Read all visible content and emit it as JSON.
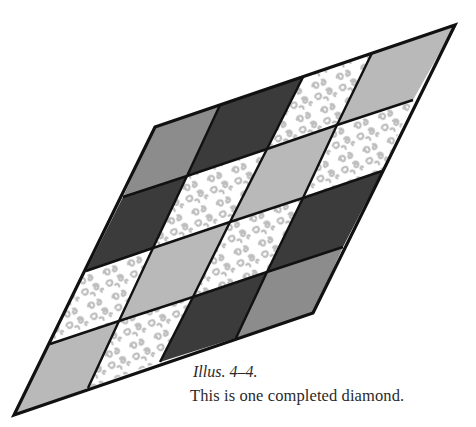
{
  "figure": {
    "grid_rows": 4,
    "grid_cols": 4,
    "vertices": [
      [
        [
          155,
          127
        ],
        [
          220,
          105
        ],
        [
          303,
          77
        ],
        [
          372,
          53
        ],
        [
          455,
          25
        ]
      ],
      [
        [
          123,
          197
        ],
        [
          187,
          176
        ],
        [
          267,
          149
        ],
        [
          337,
          125
        ],
        [
          413,
          100
        ]
      ],
      [
        [
          86,
          271
        ],
        [
          153,
          248
        ],
        [
          230,
          222
        ],
        [
          303,
          198
        ],
        [
          382,
          171
        ]
      ],
      [
        [
          50,
          344
        ],
        [
          119,
          321
        ],
        [
          193,
          297
        ],
        [
          267,
          272
        ],
        [
          343,
          247
        ]
      ],
      [
        [
          14,
          415
        ],
        [
          88,
          388
        ],
        [
          160,
          362
        ],
        [
          236,
          338
        ],
        [
          313,
          313
        ]
      ]
    ],
    "cells": [
      [
        "medium",
        "dark",
        "print",
        "light"
      ],
      [
        "dark",
        "print",
        "light",
        "print"
      ],
      [
        "print",
        "light",
        "print",
        "dark"
      ],
      [
        "light",
        "print",
        "dark",
        "medium"
      ]
    ],
    "fabric_colors": {
      "dark": "#3b3b3b",
      "medium": "#8c8c8c",
      "light": "#b9b9b9",
      "print": "#ffffff",
      "print_motif": "#bdbdbd",
      "outline": "#111111"
    }
  },
  "caption": {
    "label": "Illus. 4–4.",
    "text": "This is one completed diamond."
  }
}
